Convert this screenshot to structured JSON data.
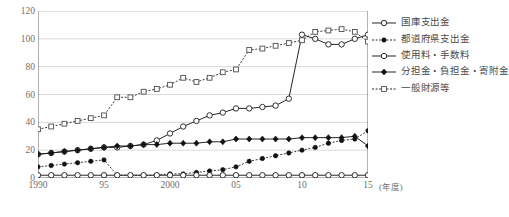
{
  "title": "",
  "axis": {
    "y_unit": "",
    "x_unit": "(年度)",
    "yticks": [
      0,
      20,
      40,
      60,
      80,
      100,
      120
    ],
    "xticks": [
      "1990",
      "95",
      "2000",
      "05",
      "10",
      "15"
    ],
    "xtick_years": [
      1990,
      1995,
      2000,
      2005,
      2010,
      2015
    ]
  },
  "legend": {
    "items": [
      {
        "label": "国庫支出金",
        "marker": "open-circle",
        "line": "solid",
        "color": "#222222"
      },
      {
        "label": "都道府県支出金",
        "marker": "filled-circle",
        "line": "dotted",
        "color": "#111111"
      },
      {
        "label": "使用料・手数料",
        "marker": "open-circle",
        "line": "solid",
        "color": "#222222"
      },
      {
        "label": "分担金・負担金・寄附金",
        "marker": "filled-diamond",
        "line": "solid",
        "color": "#111111"
      },
      {
        "label": "一般財源等",
        "marker": "open-square",
        "line": "dotted",
        "color": "#555555"
      }
    ]
  },
  "chart_data": {
    "type": "line",
    "title": "",
    "xlabel": "(年度)",
    "ylabel": "",
    "ylim": [
      0,
      120
    ],
    "xlim": [
      1990,
      2015
    ],
    "grid": true,
    "legend_position": "right",
    "x": [
      1990,
      1991,
      1992,
      1993,
      1994,
      1995,
      1996,
      1997,
      1998,
      1999,
      2000,
      2001,
      2002,
      2003,
      2004,
      2005,
      2006,
      2007,
      2008,
      2009,
      2010,
      2011,
      2012,
      2013,
      2014,
      2015
    ],
    "series": [
      {
        "name": "国庫支出金",
        "marker": "open-circle",
        "line": "solid",
        "values": [
          17,
          18,
          19,
          20,
          21,
          22,
          22,
          23,
          24,
          27,
          32,
          37,
          41,
          45,
          47,
          50,
          50,
          51,
          52,
          57,
          103,
          100,
          96,
          96,
          100,
          103
        ]
      },
      {
        "name": "都道府県支出金",
        "marker": "filled-circle",
        "line": "dotted",
        "values": [
          8,
          9,
          10,
          11,
          12,
          13,
          2,
          2,
          2,
          2,
          3,
          3,
          4,
          5,
          6,
          8,
          12,
          14,
          16,
          18,
          20,
          22,
          25,
          27,
          28,
          34
        ],
        "note": "series drops sharply at 1996 and rises again from 2005"
      },
      {
        "name": "使用料・手数料",
        "marker": "open-circle",
        "line": "solid",
        "values": [
          2,
          2,
          2,
          2,
          2,
          2,
          2,
          2,
          2,
          2,
          2,
          2,
          2,
          2,
          2,
          2,
          2,
          2,
          2,
          2,
          2,
          2,
          2,
          2,
          2,
          2
        ]
      },
      {
        "name": "分担金・負担金・寄附金",
        "marker": "filled-diamond",
        "line": "solid",
        "values": [
          17,
          18,
          19,
          20,
          21,
          22,
          23,
          23,
          24,
          24,
          25,
          25,
          25,
          26,
          26,
          28,
          28,
          28,
          28,
          28,
          29,
          29,
          29,
          29,
          30,
          23
        ]
      },
      {
        "name": "一般財源等",
        "marker": "open-square",
        "line": "dotted",
        "values": [
          35,
          37,
          39,
          41,
          43,
          45,
          58,
          58,
          62,
          64,
          67,
          72,
          69,
          72,
          76,
          78,
          92,
          93,
          95,
          97,
          99,
          105,
          106,
          107,
          105,
          98
        ]
      }
    ]
  }
}
